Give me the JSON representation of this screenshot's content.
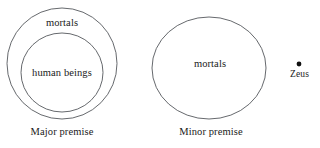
{
  "figure": {
    "type": "euler-diagram",
    "background_color": "#ffffff",
    "stroke_color": "#55585c",
    "text_color": "#1a1a1a",
    "panels": [
      {
        "caption": "Major premise",
        "sets": [
          {
            "label": "mortals",
            "role": "outer-circle"
          },
          {
            "label": "human beings",
            "role": "inner-circle"
          }
        ]
      },
      {
        "caption": "Minor premise",
        "sets": [
          {
            "label": "mortals",
            "role": "circle"
          }
        ],
        "points": [
          {
            "label": "Zeus",
            "role": "point-outside-circle"
          }
        ]
      }
    ]
  },
  "major_premise": {
    "outer_set_label": "mortals",
    "inner_set_label": "human beings",
    "caption": "Major premise"
  },
  "minor_premise": {
    "set_label": "mortals",
    "point_label": "Zeus",
    "caption": "Minor premise"
  }
}
